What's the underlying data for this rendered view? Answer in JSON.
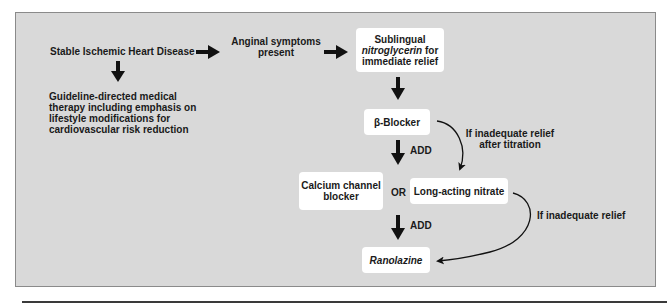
{
  "diagram": {
    "title": "",
    "nodes": {
      "sihd": "Stable Ischemic Heart Disease",
      "gdmt": "Guideline-directed medical therapy including emphasis on lifestyle modifications for cardiovascular risk reduction",
      "gdmt_lines": [
        "Guideline-directed medical",
        "therapy including emphasis on",
        "lifestyle modifications for",
        "cardiovascular risk reduction"
      ],
      "angina_lines": [
        "Anginal symptoms",
        "present"
      ],
      "sl_ntg": {
        "line1": "Sublingual",
        "line2_italic": "nitroglycerin",
        "line2_rest": " for",
        "line3": "immediate relief"
      },
      "beta_blocker": "β-Blocker",
      "ccb_lines": [
        "Calcium channel",
        "blocker"
      ],
      "or_label": "OR",
      "long_acting_nitrate": "Long-acting nitrate",
      "ranolazine": "Ranolazine"
    },
    "edge_labels": {
      "add_1": "ADD",
      "add_2": "ADD",
      "titration_lines": [
        "If inadequate relief",
        "after titration"
      ],
      "inadequate_relief": "If inadequate relief"
    },
    "colors": {
      "background_panel": "#d9d9d9",
      "box_fill": "#ffffff",
      "text": "#1a1a1a",
      "arrow": "#111111"
    }
  }
}
